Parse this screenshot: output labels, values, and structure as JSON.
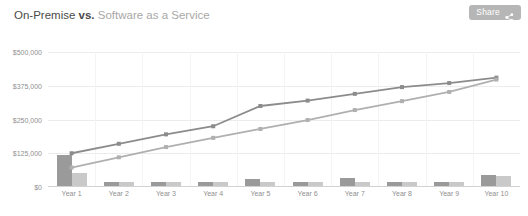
{
  "header": {
    "title_main": "On-Premise",
    "title_vs": "vs.",
    "title_sub": "Software as a Service",
    "share_label": "Share",
    "share_icon": "share-nodes-icon",
    "button_color": "#b6b6b6"
  },
  "chart_data": {
    "type": "bar",
    "xlabel": "",
    "ylabel": "",
    "ylim": [
      0,
      500000
    ],
    "yticks": [
      0,
      125000,
      250000,
      375000,
      500000
    ],
    "ytick_labels": [
      "$0",
      "$125,000",
      "$250,000",
      "$375,000",
      "$500,000"
    ],
    "grid": true,
    "legend": "none",
    "categories": [
      "Year 1",
      "Year 2",
      "Year 3",
      "Year 4",
      "Year 5",
      "Year 6",
      "Year 7",
      "Year 8",
      "Year 9",
      "Year 10"
    ],
    "series": [
      {
        "name": "On-Premise annual cost",
        "type": "bar",
        "color": "#9a9a9a",
        "values": [
          118000,
          19000,
          19000,
          19000,
          30000,
          19000,
          33000,
          19000,
          19000,
          45000
        ]
      },
      {
        "name": "Software as a Service annual cost",
        "type": "bar",
        "color": "#c9c9c9",
        "values": [
          52000,
          19000,
          19000,
          19000,
          19000,
          19000,
          19000,
          19000,
          19000,
          41000
        ]
      },
      {
        "name": "On-Premise cumulative cost",
        "type": "line",
        "color": "#8c8c8c",
        "values": [
          125000,
          160000,
          195000,
          225000,
          300000,
          320000,
          345000,
          370000,
          385000,
          405000
        ]
      },
      {
        "name": "Software as a Service cumulative cost",
        "type": "line",
        "color": "#b0b0b0",
        "values": [
          72000,
          110000,
          148000,
          182000,
          215000,
          248000,
          285000,
          318000,
          352000,
          398000
        ]
      }
    ]
  }
}
